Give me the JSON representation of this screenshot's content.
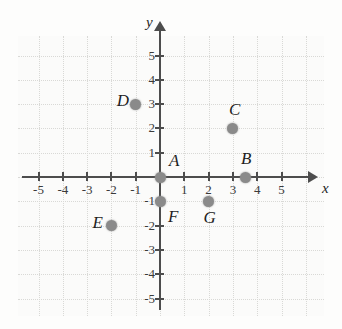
{
  "chart_data": {
    "type": "scatter",
    "title": "",
    "xlabel": "x",
    "ylabel": "y",
    "xlim": [
      -5.8,
      5.8
    ],
    "ylim": [
      -5.8,
      5.8
    ],
    "grid": true,
    "legend": "none",
    "x_ticks": [
      "-5",
      "-4",
      "-3",
      "-2",
      "-1",
      "1",
      "2",
      "3",
      "4",
      "5"
    ],
    "y_ticks": [
      "5",
      "4",
      "3",
      "2",
      "1",
      "-1",
      "-2",
      "-3",
      "-4",
      "-5"
    ],
    "points": [
      {
        "label": "A",
        "x": 0,
        "y": 0,
        "label_pos": "up-right"
      },
      {
        "label": "B",
        "x": 3.5,
        "y": 0,
        "label_pos": "up"
      },
      {
        "label": "C",
        "x": 3,
        "y": 2,
        "label_pos": "up"
      },
      {
        "label": "D",
        "x": -1,
        "y": 3,
        "label_pos": "left"
      },
      {
        "label": "E",
        "x": -2,
        "y": -2,
        "label_pos": "left"
      },
      {
        "label": "F",
        "x": 0,
        "y": -1,
        "label_pos": "down-right"
      },
      {
        "label": "G",
        "x": 2,
        "y": -1,
        "label_pos": "down"
      }
    ],
    "point_color": "#8a8a8a",
    "axis_color": "#4d4d4d",
    "grid_color": "#d9d9d6",
    "background_color": "#fbfbfa"
  }
}
